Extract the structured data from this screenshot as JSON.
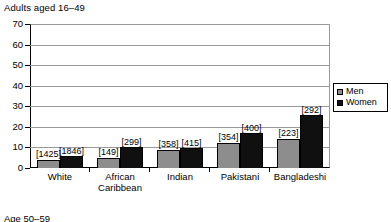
{
  "chart_data": {
    "type": "bar",
    "title": "Adults aged 16–49",
    "xlabel": "",
    "ylabel": "",
    "ylim": [
      0,
      70
    ],
    "yticks": [
      0,
      10,
      20,
      30,
      40,
      50,
      60,
      70
    ],
    "grid": true,
    "legend_position": "right",
    "categories": [
      "White",
      "African Caribbean",
      "Indian",
      "Pakistani",
      "Bangladeshi"
    ],
    "category_lines": [
      [
        "White"
      ],
      [
        "African",
        "Caribbean"
      ],
      [
        "Indian"
      ],
      [
        "Pakistani"
      ],
      [
        "Bangladeshi"
      ]
    ],
    "series": [
      {
        "name": "Men",
        "color": "#8d8d8d",
        "values": [
          4,
          5,
          9,
          12,
          14
        ],
        "labels": [
          "[1425]",
          "[149]",
          "[358]",
          "[354]",
          "[223]"
        ]
      },
      {
        "name": "Women",
        "color": "#101010",
        "values": [
          6,
          10,
          9.5,
          17,
          26
        ],
        "labels": [
          "[1846]",
          "[299]",
          "[415]",
          "[400]",
          "[292]"
        ]
      }
    ]
  },
  "legend": {
    "items": [
      {
        "label": "Men"
      },
      {
        "label": "Women"
      }
    ]
  },
  "bottom_caption": "Age 50–59"
}
